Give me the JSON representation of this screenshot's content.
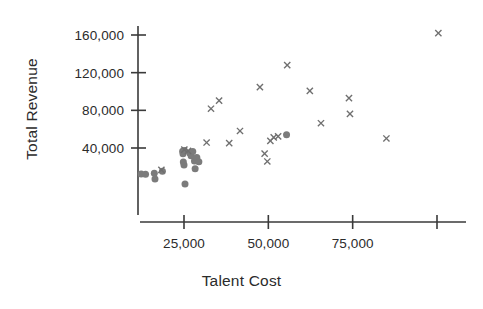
{
  "chart_data": {
    "type": "scatter",
    "title": "",
    "xlabel": "Talent Cost",
    "ylabel": "Total Revenue",
    "xlim": [
      8000,
      108000
    ],
    "ylim": [
      -3000,
      170000
    ],
    "xticks": [
      25000,
      50000,
      75000,
      100000
    ],
    "xticklabels": [
      "25,000",
      "50,000",
      "75,000",
      ""
    ],
    "yticks": [
      40000,
      80000,
      120000,
      160000
    ],
    "yticklabels": [
      "40,000",
      "80,000",
      "120,000",
      "160,000"
    ],
    "grid": false,
    "legend": "none",
    "series": [
      {
        "name": "circle-series",
        "marker": "circle",
        "color": "#7b7b7b",
        "points": [
          [
            12300,
            12500
          ],
          [
            13600,
            12000
          ],
          [
            16200,
            13200
          ],
          [
            16400,
            7100
          ],
          [
            18600,
            15300
          ],
          [
            24600,
            36600
          ],
          [
            24700,
            33800
          ],
          [
            24800,
            25200
          ],
          [
            25000,
            22000
          ],
          [
            25100,
            37400
          ],
          [
            25300,
            1900
          ],
          [
            26700,
            34800
          ],
          [
            27100,
            31800
          ],
          [
            27600,
            36200
          ],
          [
            28100,
            26300
          ],
          [
            28300,
            17900
          ],
          [
            28800,
            29800
          ],
          [
            29400,
            25400
          ],
          [
            55400,
            54200
          ]
        ]
      },
      {
        "name": "cross-series",
        "marker": "x",
        "color": "#6f6f6f",
        "points": [
          [
            18300,
            16800
          ],
          [
            25100,
            38200
          ],
          [
            26200,
            36900
          ],
          [
            31700,
            45800
          ],
          [
            33000,
            81700
          ],
          [
            35400,
            90300
          ],
          [
            38400,
            45200
          ],
          [
            41600,
            58100
          ],
          [
            47500,
            104600
          ],
          [
            48900,
            34000
          ],
          [
            49700,
            25700
          ],
          [
            50600,
            47600
          ],
          [
            51600,
            51300
          ],
          [
            52900,
            52400
          ],
          [
            55600,
            128000
          ],
          [
            62300,
            100700
          ],
          [
            65600,
            66300
          ],
          [
            73900,
            93000
          ],
          [
            74200,
            76300
          ],
          [
            85000,
            50100
          ],
          [
            100400,
            162000
          ]
        ]
      }
    ]
  },
  "axes": {
    "x_axis_pixel_y": 222,
    "y_axis_pixel_x": 138
  }
}
